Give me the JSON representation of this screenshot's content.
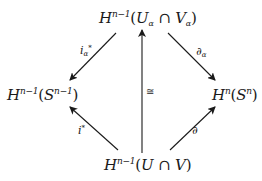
{
  "diagram": {
    "type": "commutative-diagram",
    "nodes": {
      "top": {
        "base": "H",
        "exp": "n−1",
        "open": "(",
        "a": "U",
        "a_sub": "α",
        "op": " ∩ ",
        "b": "V",
        "b_sub": "α",
        "close": ")"
      },
      "left": {
        "base": "H",
        "exp": "n−1",
        "open": "(",
        "a": "S",
        "a_exp": "n−1",
        "close": ")"
      },
      "right": {
        "base": "H",
        "exp": "n",
        "open": "(",
        "a": "S",
        "a_exp": "n",
        "close": ")"
      },
      "bottom": {
        "base": "H",
        "exp": "n−1",
        "open": "(",
        "a": "U",
        "op": " ∩ ",
        "b": "V",
        "close": ")"
      }
    },
    "edges": [
      {
        "from": "top",
        "to": "left",
        "label": "i",
        "label_sub": "α",
        "label_sup": "*"
      },
      {
        "from": "top",
        "to": "right",
        "label": "∂",
        "label_sub": "α"
      },
      {
        "from": "bottom",
        "to": "left",
        "label": "i",
        "label_sup": "*"
      },
      {
        "from": "bottom",
        "to": "right",
        "label": "∂"
      },
      {
        "from": "bottom",
        "to": "top",
        "label": "≅"
      }
    ],
    "colors": {
      "ink": "#1a1a1a",
      "background": "#ffffff"
    }
  }
}
